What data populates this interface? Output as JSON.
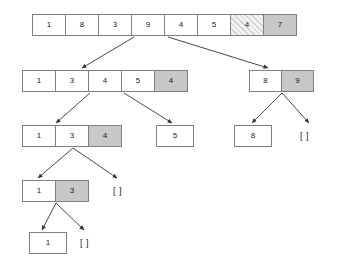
{
  "diagram": {
    "colors": {
      "cell_border": "#808080",
      "cell_fill": "#ffffff",
      "pivot_fill": "#c8c8c8",
      "hatch_fill": "#f2f2f2",
      "edge": "#333333",
      "text": "#1a1a1a"
    },
    "empty_label": "[ ]",
    "levels": [
      {
        "id": "level-0",
        "nodes": [
          {
            "id": "root",
            "type": "array",
            "x": 32,
            "y": 14,
            "cell_w": 34,
            "cell_h": 22,
            "cells": [
              {
                "value": "1",
                "style": "plain"
              },
              {
                "value": "8",
                "style": "plain"
              },
              {
                "value": "3",
                "style": "plain"
              },
              {
                "value": "9",
                "style": "plain"
              },
              {
                "value": "4",
                "style": "plain"
              },
              {
                "value": "5",
                "style": "plain"
              },
              {
                "value": "4",
                "style": "hatch"
              },
              {
                "value": "7",
                "style": "pivot"
              }
            ]
          }
        ]
      },
      {
        "id": "level-1",
        "nodes": [
          {
            "id": "left-1",
            "type": "array",
            "x": 22,
            "y": 70,
            "cell_w": 34,
            "cell_h": 22,
            "cells": [
              {
                "value": "1",
                "style": "plain"
              },
              {
                "value": "3",
                "style": "plain"
              },
              {
                "value": "4",
                "style": "plain"
              },
              {
                "value": "5",
                "style": "plain"
              },
              {
                "value": "4",
                "style": "pivot"
              }
            ]
          },
          {
            "id": "right-1",
            "type": "array",
            "x": 249,
            "y": 70,
            "cell_w": 33,
            "cell_h": 22,
            "cells": [
              {
                "value": "8",
                "style": "plain"
              },
              {
                "value": "9",
                "style": "pivot"
              }
            ]
          }
        ]
      },
      {
        "id": "level-2",
        "nodes": [
          {
            "id": "left-2",
            "type": "array",
            "x": 22,
            "y": 125,
            "cell_w": 34,
            "cell_h": 22,
            "cells": [
              {
                "value": "1",
                "style": "plain"
              },
              {
                "value": "3",
                "style": "plain"
              },
              {
                "value": "4",
                "style": "pivot"
              }
            ]
          },
          {
            "id": "mid-2",
            "type": "array",
            "x": 156,
            "y": 125,
            "cell_w": 38,
            "cell_h": 22,
            "cells": [
              {
                "value": "5",
                "style": "plain"
              }
            ]
          },
          {
            "id": "right-2a",
            "type": "array",
            "x": 234,
            "y": 125,
            "cell_w": 38,
            "cell_h": 22,
            "cells": [
              {
                "value": "8",
                "style": "plain"
              }
            ]
          },
          {
            "id": "right-2b",
            "type": "empty",
            "x": 300,
            "y": 131,
            "value": "[ ]"
          }
        ]
      },
      {
        "id": "level-3",
        "nodes": [
          {
            "id": "left-3",
            "type": "array",
            "x": 22,
            "y": 180,
            "cell_w": 34,
            "cell_h": 22,
            "cells": [
              {
                "value": "1",
                "style": "plain"
              },
              {
                "value": "3",
                "style": "pivot"
              }
            ]
          },
          {
            "id": "right-3",
            "type": "empty",
            "x": 113,
            "y": 186,
            "value": "[ ]"
          }
        ]
      },
      {
        "id": "level-4",
        "nodes": [
          {
            "id": "left-4",
            "type": "array",
            "x": 29,
            "y": 232,
            "cell_w": 38,
            "cell_h": 22,
            "cells": [
              {
                "value": "1",
                "style": "plain"
              }
            ]
          },
          {
            "id": "right-4",
            "type": "empty",
            "x": 80,
            "y": 238,
            "value": "[ ]"
          }
        ]
      }
    ],
    "edges": [
      {
        "id": "edge-root-left",
        "x1": 134,
        "y1": 37,
        "x2": 82,
        "y2": 68
      },
      {
        "id": "edge-root-right",
        "x1": 168,
        "y1": 37,
        "x2": 268,
        "y2": 68
      },
      {
        "id": "edge-l1-left",
        "x1": 90,
        "y1": 93,
        "x2": 56,
        "y2": 123
      },
      {
        "id": "edge-l1-right",
        "x1": 124,
        "y1": 93,
        "x2": 172,
        "y2": 123
      },
      {
        "id": "edge-r1-left",
        "x1": 282,
        "y1": 93,
        "x2": 252,
        "y2": 123
      },
      {
        "id": "edge-r1-right",
        "x1": 282,
        "y1": 93,
        "x2": 309,
        "y2": 123
      },
      {
        "id": "edge-l2-left",
        "x1": 73,
        "y1": 148,
        "x2": 38,
        "y2": 178
      },
      {
        "id": "edge-l2-right",
        "x1": 73,
        "y1": 148,
        "x2": 117,
        "y2": 178
      },
      {
        "id": "edge-l3-left",
        "x1": 56,
        "y1": 203,
        "x2": 42,
        "y2": 230
      },
      {
        "id": "edge-l3-right",
        "x1": 56,
        "y1": 203,
        "x2": 84,
        "y2": 230
      }
    ]
  }
}
